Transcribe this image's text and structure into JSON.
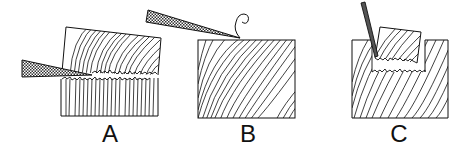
{
  "diagram": {
    "panels": [
      {
        "id": "A",
        "label": "A",
        "caption": "wedge splitting block along grain"
      },
      {
        "id": "B",
        "label": "B",
        "caption": "blade cutting shaving from top surface"
      },
      {
        "id": "C",
        "label": "C",
        "caption": "chisel removing a notch chip"
      }
    ],
    "colors": {
      "ink": "#111111",
      "background": "#ffffff",
      "hatch": "#555555"
    }
  }
}
